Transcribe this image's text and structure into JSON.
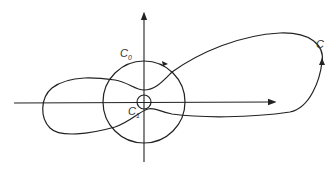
{
  "diagram": {
    "type": "contour-plot",
    "labels": {
      "outer_contour": "C",
      "big_circle": "C",
      "big_circle_sub": "0",
      "small_circle": "C",
      "small_circle_sub": "1"
    },
    "colors": {
      "stroke": "#222222",
      "background": "#ffffff"
    }
  }
}
